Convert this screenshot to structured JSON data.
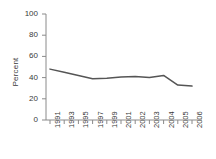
{
  "chart_data": {
    "type": "line",
    "title": "",
    "xlabel": "",
    "ylabel": "Percent",
    "ylim": [
      0,
      100
    ],
    "yticks": [
      0,
      20,
      40,
      60,
      80,
      100
    ],
    "grid": false,
    "legend": false,
    "categories": [
      "1991",
      "1993",
      "1995",
      "1997",
      "1999",
      "2001",
      "2002",
      "2003",
      "2004",
      "2005",
      "2006"
    ],
    "values": [
      48,
      45,
      42,
      39,
      39.5,
      40.5,
      41,
      40,
      42,
      33,
      32
    ],
    "series": [
      {
        "name": "Percent",
        "values": [
          48,
          45,
          42,
          39,
          39.5,
          40.5,
          41,
          40,
          42,
          33,
          32
        ]
      }
    ],
    "line_color": "#555555",
    "axis_color": "#8a8a8a"
  }
}
